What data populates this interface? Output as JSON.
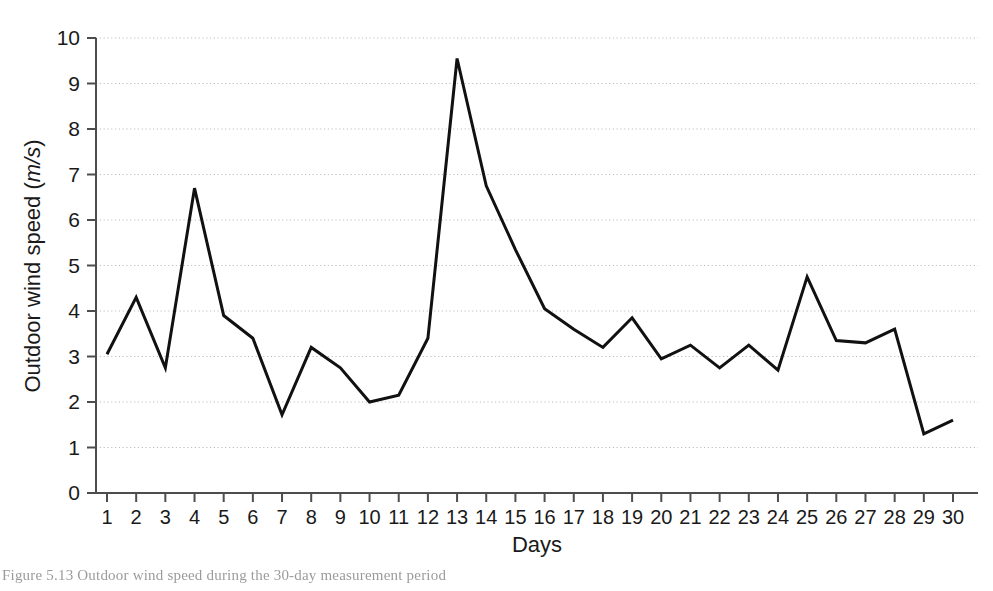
{
  "chart_data": {
    "type": "line",
    "title": "",
    "xlabel": "Days",
    "ylabel": "Outdoor wind speed (m/s)",
    "ylabel_plain": "Outdoor wind speed (",
    "ylabel_italic": "m/s",
    "ylabel_close": ")",
    "x": [
      1,
      2,
      3,
      4,
      5,
      6,
      7,
      8,
      9,
      10,
      11,
      12,
      13,
      14,
      15,
      16,
      17,
      18,
      19,
      20,
      21,
      22,
      23,
      24,
      25,
      26,
      27,
      28,
      29,
      30
    ],
    "categories": [
      "1",
      "2",
      "3",
      "4",
      "5",
      "6",
      "7",
      "8",
      "9",
      "10",
      "11",
      "12",
      "13",
      "14",
      "15",
      "16",
      "17",
      "18",
      "19",
      "20",
      "21",
      "22",
      "23",
      "24",
      "25",
      "26",
      "27",
      "28",
      "29",
      "30"
    ],
    "values": [
      3.05,
      4.3,
      2.75,
      6.7,
      3.9,
      3.4,
      1.72,
      3.2,
      2.75,
      2.0,
      2.15,
      3.4,
      9.55,
      6.75,
      5.35,
      4.05,
      3.6,
      3.2,
      3.85,
      2.95,
      3.25,
      2.75,
      3.25,
      2.7,
      4.75,
      3.35,
      3.3,
      3.6,
      1.3,
      1.6
    ],
    "series": [
      {
        "name": "Outdoor wind speed",
        "values": [
          3.05,
          4.3,
          2.75,
          6.7,
          3.9,
          3.4,
          1.72,
          3.2,
          2.75,
          2.0,
          2.15,
          3.4,
          9.55,
          6.75,
          5.35,
          4.05,
          3.6,
          3.2,
          3.85,
          2.95,
          3.25,
          2.75,
          3.25,
          2.7,
          4.75,
          3.35,
          3.3,
          3.6,
          1.3,
          1.6
        ],
        "color": "#111111",
        "line_width": 3
      }
    ],
    "ylim": [
      0,
      10
    ],
    "xlim": [
      1,
      30
    ],
    "y_ticks": [
      0,
      1,
      2,
      3,
      4,
      5,
      6,
      7,
      8,
      9,
      10
    ],
    "y_tick_labels": [
      "0",
      "1",
      "2",
      "3",
      "4",
      "5",
      "6",
      "7",
      "8",
      "9",
      "10"
    ],
    "grid": true,
    "grid_axis": "y",
    "grid_style": "dotted",
    "grid_color": "#bdbdbd",
    "legend": null,
    "legend_position": "none",
    "annotations": [],
    "axis_color": "#4d4d4d",
    "background": "#ffffff"
  },
  "caption": {
    "text": "Figure 5.13  Outdoor wind speed during the 30-day measurement period"
  }
}
